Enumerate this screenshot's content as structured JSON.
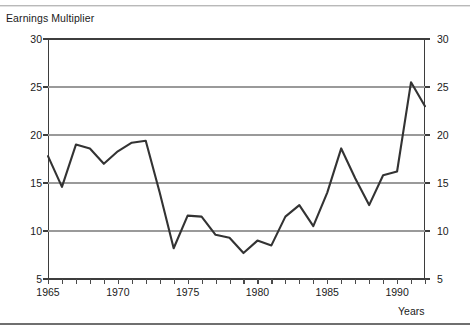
{
  "axis_titles": {
    "y_title": "Earnings Multiplier",
    "x_title": "Years"
  },
  "y_ticks": [
    "30",
    "25",
    "20",
    "15",
    "10",
    "5"
  ],
  "x_ticks": [
    "1965",
    "1970",
    "1975",
    "1980",
    "1985",
    "1990"
  ],
  "colors": {
    "line": "#333333",
    "grid": "#9a9a9a",
    "axis": "#3d3d3d",
    "text": "#1a1a1a",
    "background": "#ffffff"
  },
  "chart_data": {
    "type": "line",
    "title": "",
    "xlabel": "Years",
    "ylabel": "Earnings Multiplier",
    "xlim": [
      1965,
      1992
    ],
    "ylim": [
      5,
      30
    ],
    "yticks": [
      5,
      10,
      15,
      20,
      25,
      30
    ],
    "xticks": [
      1965,
      1970,
      1975,
      1980,
      1985,
      1990
    ],
    "grid": true,
    "legend": null,
    "x": [
      1965,
      1966,
      1967,
      1968,
      1969,
      1970,
      1971,
      1972,
      1973,
      1974,
      1975,
      1976,
      1977,
      1978,
      1979,
      1980,
      1981,
      1982,
      1983,
      1984,
      1985,
      1986,
      1987,
      1988,
      1989,
      1990,
      1991,
      1992
    ],
    "values": [
      17.8,
      14.6,
      19.0,
      18.6,
      17.0,
      18.3,
      19.2,
      19.4,
      14.0,
      8.2,
      11.6,
      11.5,
      9.6,
      9.3,
      7.7,
      9.0,
      8.5,
      11.5,
      12.7,
      10.5,
      14.0,
      18.6,
      15.5,
      12.7,
      15.8,
      16.2,
      25.5,
      23.0
    ],
    "series": [
      {
        "name": "Earnings Multiplier",
        "values": [
          17.8,
          14.6,
          19.0,
          18.6,
          17.0,
          18.3,
          19.2,
          19.4,
          14.0,
          8.2,
          11.6,
          11.5,
          9.6,
          9.3,
          7.7,
          9.0,
          8.5,
          11.5,
          12.7,
          10.5,
          14.0,
          18.6,
          15.5,
          12.7,
          15.8,
          16.2,
          25.5,
          23.0
        ]
      }
    ]
  }
}
